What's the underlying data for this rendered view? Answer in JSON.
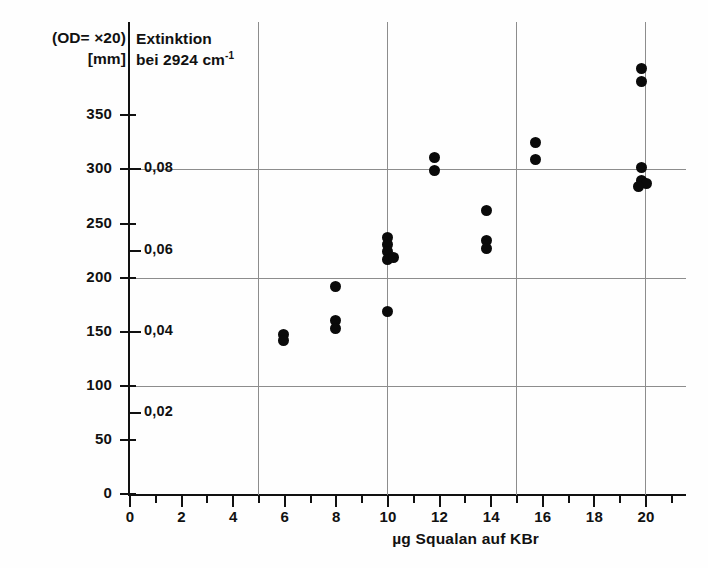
{
  "header": {
    "left_line1": "(OD= ×20)",
    "left_line2": "[mm]",
    "right_line1": "Extinktion",
    "right_line2_pre": "bei 2924 cm",
    "right_line2_sup": "-1"
  },
  "axes": {
    "x_title": "µg Squalan auf KBr",
    "y_unit_label": "[mm]",
    "y_secondary_name": "Extinktion"
  },
  "chart_data": {
    "type": "scatter",
    "title": "Extinktion bei 2924 cm-1",
    "subtitle": "(OD= ×20) [mm]",
    "xlabel": "µg Squalan auf KBr",
    "ylabel": "(OD= ×20) [mm]",
    "y2label": "Extinktion",
    "xlim": [
      0,
      21.5
    ],
    "ylim": [
      0,
      400
    ],
    "grid": "major gridlines at y=100,200,300 and x=5,10,15,20",
    "legend": "none",
    "xticks_major": [
      0,
      2,
      4,
      6,
      8,
      10,
      12,
      14,
      16,
      18,
      20
    ],
    "xticks_minor": [
      1,
      3,
      5,
      7,
      9,
      11,
      13,
      15,
      17,
      19,
      21
    ],
    "yticks_left": [
      0,
      50,
      100,
      150,
      200,
      250,
      300,
      350
    ],
    "ytick_left_labels": [
      "0",
      "50",
      "100",
      "150",
      "200",
      "250",
      "300",
      "350"
    ],
    "yticks_right_values": [
      75,
      150,
      225,
      300
    ],
    "ytick_right_labels": [
      "0,02",
      "0,04",
      "0,06",
      "0,08"
    ],
    "points": [
      {
        "x": 6.0,
        "y": 147
      },
      {
        "x": 6.0,
        "y": 142
      },
      {
        "x": 8.0,
        "y": 192
      },
      {
        "x": 8.0,
        "y": 160
      },
      {
        "x": 8.0,
        "y": 153
      },
      {
        "x": 10.0,
        "y": 237
      },
      {
        "x": 10.0,
        "y": 231
      },
      {
        "x": 10.0,
        "y": 224
      },
      {
        "x": 10.0,
        "y": 217
      },
      {
        "x": 10.25,
        "y": 219
      },
      {
        "x": 10.0,
        "y": 169
      },
      {
        "x": 11.85,
        "y": 311
      },
      {
        "x": 11.85,
        "y": 299
      },
      {
        "x": 13.85,
        "y": 262
      },
      {
        "x": 13.85,
        "y": 234
      },
      {
        "x": 13.85,
        "y": 227
      },
      {
        "x": 15.75,
        "y": 325
      },
      {
        "x": 15.75,
        "y": 309
      },
      {
        "x": 19.85,
        "y": 393
      },
      {
        "x": 19.85,
        "y": 381
      },
      {
        "x": 19.85,
        "y": 302
      },
      {
        "x": 19.85,
        "y": 290
      },
      {
        "x": 20.05,
        "y": 287
      },
      {
        "x": 19.75,
        "y": 284
      }
    ]
  }
}
